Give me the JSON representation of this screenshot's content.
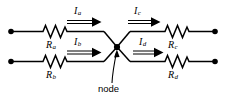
{
  "diagram": {
    "colors": {
      "wire": "#000000",
      "background": "#ffffff",
      "text": "#000000"
    },
    "node_label": "node",
    "resistors": [
      {
        "id": "Ra",
        "symbol": "R",
        "subscript": "a",
        "position": "top-left"
      },
      {
        "id": "Rb",
        "symbol": "R",
        "subscript": "b",
        "position": "bottom-left"
      },
      {
        "id": "Rc",
        "symbol": "R",
        "subscript": "c",
        "position": "top-right"
      },
      {
        "id": "Rd",
        "symbol": "R",
        "subscript": "d",
        "position": "bottom-right"
      }
    ],
    "currents": [
      {
        "id": "Ia",
        "symbol": "I",
        "subscript": "a",
        "direction": "right",
        "branch": "top-left"
      },
      {
        "id": "Ib",
        "symbol": "I",
        "subscript": "b",
        "direction": "right",
        "branch": "bottom-left"
      },
      {
        "id": "Ic",
        "symbol": "I",
        "subscript": "c",
        "direction": "right",
        "branch": "top-right"
      },
      {
        "id": "Id",
        "symbol": "I",
        "subscript": "d",
        "direction": "right",
        "branch": "bottom-right"
      }
    ],
    "terminals": [
      {
        "id": "terminal-top-left",
        "position": "left"
      },
      {
        "id": "terminal-bottom-left",
        "position": "left"
      },
      {
        "id": "terminal-top-right",
        "position": "right"
      },
      {
        "id": "terminal-bottom-right",
        "position": "right"
      }
    ]
  }
}
